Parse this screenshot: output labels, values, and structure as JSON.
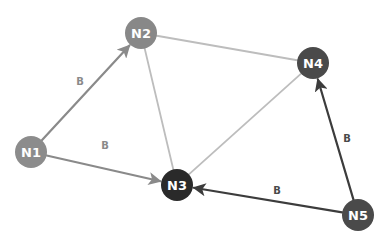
{
  "diagram": {
    "type": "directed-graph",
    "nodes": [
      {
        "id": "N1",
        "label": "N1",
        "color": "#8c8c8c"
      },
      {
        "id": "N2",
        "label": "N2",
        "color": "#888888"
      },
      {
        "id": "N3",
        "label": "N3",
        "color": "#2a2a2a"
      },
      {
        "id": "N4",
        "label": "N4",
        "color": "#4a4a4a"
      },
      {
        "id": "N5",
        "label": "N5",
        "color": "#4a4a4a"
      }
    ],
    "edges": [
      {
        "from": "N2",
        "to": "N4",
        "directed": false,
        "label": "",
        "color": "#bdbdbd"
      },
      {
        "from": "N2",
        "to": "N3",
        "directed": false,
        "label": "",
        "color": "#bdbdbd"
      },
      {
        "from": "N4",
        "to": "N3",
        "directed": false,
        "label": "",
        "color": "#bdbdbd"
      },
      {
        "from": "N1",
        "to": "N2",
        "directed": true,
        "label": "B",
        "color": "#8a8a8a",
        "label_color": "#8a8a8a"
      },
      {
        "from": "N1",
        "to": "N3",
        "directed": true,
        "label": "B",
        "color": "#8a8a8a",
        "label_color": "#8a8a8a"
      },
      {
        "from": "N5",
        "to": "N3",
        "directed": true,
        "label": "B",
        "color": "#3c3c3c",
        "label_color": "#4a4a4a"
      },
      {
        "from": "N5",
        "to": "N4",
        "directed": true,
        "label": "B",
        "color": "#3c3c3c",
        "label_color": "#4a4a4a"
      }
    ]
  }
}
